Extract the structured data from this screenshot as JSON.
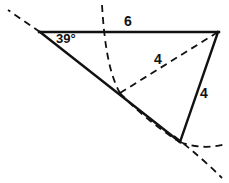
{
  "figure": {
    "kind": "geometry-diagram",
    "background_color": "#ffffff",
    "stroke_color": "#111111",
    "solid_stroke_width": 2.2,
    "dashed_stroke_width": 1.8,
    "dash_pattern": "7 5",
    "labels": {
      "angle": "39°",
      "top_side": "6",
      "cevian": "4",
      "right_side": "4"
    },
    "vertices": {
      "top_left": [
        40,
        32
      ],
      "top_right": [
        218,
        32
      ],
      "bottom": [
        180,
        142
      ],
      "intersection": [
        120,
        93
      ]
    },
    "solid_segments": [
      {
        "name": "top-side",
        "from": [
          40,
          32
        ],
        "to": [
          218,
          32
        ],
        "label": "6"
      },
      {
        "name": "left-side",
        "from": [
          40,
          32
        ],
        "to": [
          180,
          142
        ],
        "label": ""
      },
      {
        "name": "right-side",
        "from": [
          218,
          32
        ],
        "to": [
          180,
          142
        ],
        "label": "4"
      }
    ],
    "dashed_segments": [
      {
        "name": "cevian",
        "from": [
          120,
          93
        ],
        "to": [
          218,
          32
        ],
        "label": "4"
      },
      {
        "name": "exterior-ray",
        "from": [
          40,
          32
        ],
        "to": [
          8,
          10
        ],
        "label": ""
      }
    ],
    "dashed_arcs": [
      {
        "name": "upper-construction-arc",
        "path": "M 102 5 C 104 38, 108 72, 120 93"
      },
      {
        "name": "lower-construction-arc",
        "path": "M 120 93 C 134 108, 158 129, 180 142"
      },
      {
        "name": "right-arc-tail",
        "path": "M 180 142 C 196 148, 212 148, 226 144"
      },
      {
        "name": "lower-right-arc-tail",
        "path": "M 174 136 C 192 150, 208 164, 222 178"
      }
    ]
  }
}
